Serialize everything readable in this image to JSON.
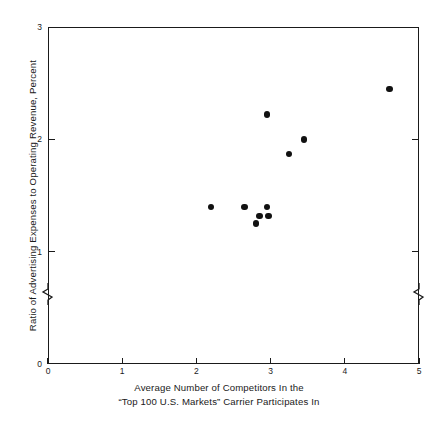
{
  "chart_data": {
    "type": "scatter",
    "title": "",
    "xlabel": "Average Number of Competitors In the “Top 100 U.S. Markets” Carrier Participates In",
    "ylabel": "Ratio of Advertising Expenses to Operating Revenue, Percent",
    "xlim": [
      0,
      5
    ],
    "ylim": [
      0,
      3
    ],
    "xticks": [
      0,
      1,
      2,
      3,
      4,
      5
    ],
    "yticks": [
      0,
      1,
      2,
      3
    ],
    "grid": false,
    "legend": null,
    "axis_break": {
      "axis": "y",
      "between": [
        0,
        1
      ],
      "note": "zigzag break symbol on left and right spines below the value 1"
    },
    "marker": {
      "shape": "circle",
      "color": "#111111",
      "size": 6.4
    },
    "points": [
      {
        "x": 2.2,
        "y": 1.4
      },
      {
        "x": 2.65,
        "y": 1.4
      },
      {
        "x": 2.95,
        "y": 1.4
      },
      {
        "x": 2.85,
        "y": 1.32
      },
      {
        "x": 2.97,
        "y": 1.32
      },
      {
        "x": 2.8,
        "y": 1.25
      },
      {
        "x": 2.95,
        "y": 2.22
      },
      {
        "x": 3.25,
        "y": 1.87
      },
      {
        "x": 3.45,
        "y": 2.0
      },
      {
        "x": 4.6,
        "y": 2.45
      }
    ]
  },
  "axes": {
    "x_tick_labels": [
      "0",
      "1",
      "2",
      "3",
      "4",
      "5"
    ],
    "y_tick_labels": [
      "0",
      "1",
      "2",
      "3"
    ],
    "x_title": "Average Number of Competitors In the",
    "x_title_line2": "“Top 100 U.S. Markets”  Carrier Participates In",
    "y_title": "Ratio of Advertising Expenses to Operating Revenue, Percent"
  },
  "colors": {
    "axis": "#1a1a1a",
    "marker": "#111111",
    "background": "#ffffff"
  }
}
